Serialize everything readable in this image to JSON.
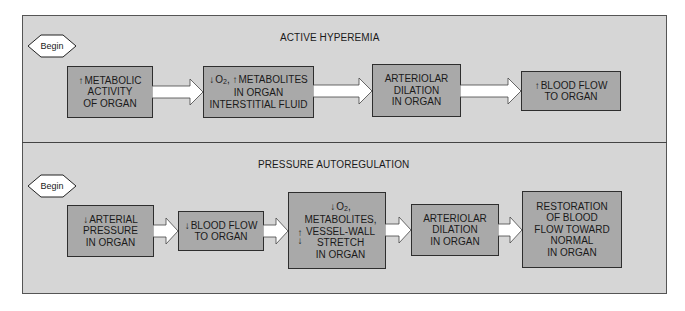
{
  "panels": [
    {
      "title": "ACTIVE HYPEREMIA",
      "begin_label": "Begin",
      "steps": [
        {
          "lines": [
            "METABOLIC",
            "ACTIVITY",
            "OF ORGAN"
          ],
          "indicator": "up"
        },
        {
          "lines": [
            "O2, METABOLITES",
            "IN ORGAN",
            "INTERSTITIAL FLUID"
          ],
          "indicator": "down-o2-up-metabolites"
        },
        {
          "lines": [
            "ARTERIOLAR",
            "DILATION",
            "IN ORGAN"
          ]
        },
        {
          "lines": [
            "BLOOD FLOW",
            "TO ORGAN"
          ],
          "indicator": "up"
        }
      ]
    },
    {
      "title": "PRESSURE AUTOREGULATION",
      "begin_label": "Begin",
      "steps": [
        {
          "lines": [
            "ARTERIAL",
            "PRESSURE",
            "IN ORGAN"
          ],
          "indicator": "down"
        },
        {
          "lines": [
            "BLOOD FLOW",
            "TO ORGAN"
          ],
          "indicator": "down"
        },
        {
          "lines": [
            "O2,",
            "METABOLITES,",
            "VESSEL-WALL",
            "STRETCH",
            "IN ORGAN"
          ],
          "indicator": "down-o2-up-metabolites-down-stretch"
        },
        {
          "lines": [
            "ARTERIOLAR",
            "DILATION",
            "IN ORGAN"
          ]
        },
        {
          "lines": [
            "RESTORATION",
            "OF BLOOD",
            "FLOW TOWARD",
            "NORMAL",
            "IN ORGAN"
          ]
        }
      ]
    }
  ],
  "text": {
    "o2": "O",
    "o2_sub": "2",
    "up_arrow": "↑",
    "down_arrow": "↓",
    "p1s1_l1": "METABOLIC",
    "p1s1_l2": "ACTIVITY",
    "p1s1_l3": "OF ORGAN",
    "p1s2_l1_rest": "METABOLITES",
    "p1s2_l2": "IN ORGAN",
    "p1s2_l3": "INTERSTITIAL FLUID",
    "p1s3_l1": "ARTERIOLAR",
    "p1s3_l2": "DILATION",
    "p1s3_l3": "IN ORGAN",
    "p1s4_l1": "BLOOD FLOW",
    "p1s4_l2": "TO ORGAN",
    "p2s1_l1": "ARTERIAL",
    "p2s1_l2": "PRESSURE",
    "p2s1_l3": "IN ORGAN",
    "p2s2_l1": "BLOOD FLOW",
    "p2s2_l2": "TO ORGAN",
    "p2s3_l2": "METABOLITES,",
    "p2s3_l3": "VESSEL-WALL",
    "p2s3_l4": "STRETCH",
    "p2s3_l5": "IN ORGAN",
    "p2s4_l1": "ARTERIOLAR",
    "p2s4_l2": "DILATION",
    "p2s4_l3": "IN ORGAN",
    "p2s5_l1": "RESTORATION",
    "p2s5_l2": "OF BLOOD",
    "p2s5_l3": "FLOW TOWARD",
    "p2s5_l4": "NORMAL",
    "p2s5_l5": "IN ORGAN"
  },
  "colors": {
    "panel_bg": "#d6d6d6",
    "box_fill": "#a9a9a9",
    "border": "#2e2e2e",
    "arrow_fill": "#ffffff"
  }
}
